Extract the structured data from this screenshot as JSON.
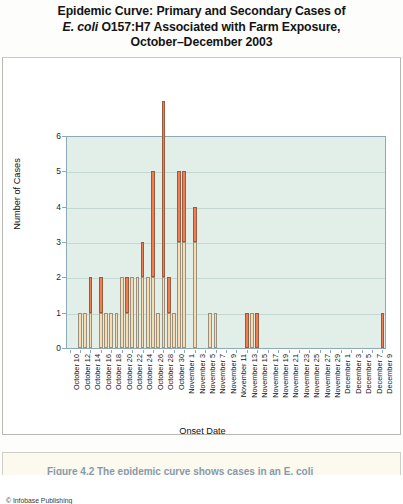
{
  "title": {
    "line1": "Epidemic Curve: Primary and Secondary Cases of",
    "line2_italic": "E. coli",
    "line2_rest": " O157:H7 Associated with Farm Exposure,",
    "line3": "October–December 2003"
  },
  "credit": "© Infobase Publishing",
  "caption": "Figure 4.2  The epidemic curve shows cases in an E. coli",
  "legend": {
    "position": "bottom",
    "items": [
      {
        "label": "Primary Cases",
        "color": "#f8dcae"
      },
      {
        "label": "Secondary cases",
        "color": "#ef7f53"
      }
    ]
  },
  "colors": {
    "primary": "#f8dcae",
    "secondary": "#ef7f53",
    "plot_background": "#e2efe9",
    "gridline": "#c3d8d3",
    "axis": "#8fa8b5"
  },
  "chart_data": {
    "type": "bar",
    "subtype": "stacked-histogram-epidemic-curve",
    "title": "Epidemic Curve: Primary and Secondary Cases of E. coli O157:H7 Associated with Farm Exposure, October–December 2003",
    "xlabel": "Onset Date",
    "ylabel": "Number of Cases",
    "ylim": [
      0,
      6
    ],
    "yticks": [
      0,
      1,
      2,
      3,
      4,
      5,
      6
    ],
    "grid": true,
    "tick_step_days": 2,
    "x_tick_labels": [
      "October 10",
      "October 12",
      "October 14",
      "October 16",
      "October 18",
      "October 20",
      "October 22",
      "October 24",
      "October 26",
      "October 28",
      "October 30",
      "November 1",
      "November 3",
      "November 5",
      "November 7",
      "November 9",
      "November 11",
      "November 13",
      "November 15",
      "November 17",
      "November 19",
      "November 21",
      "November 23",
      "November 25",
      "November 27",
      "November 29",
      "December 1",
      "December 3",
      "December 5",
      "December 7",
      "December 9"
    ],
    "x": [
      "October 10",
      "October 11",
      "October 12",
      "October 13",
      "October 14",
      "October 15",
      "October 16",
      "October 17",
      "October 18",
      "October 19",
      "October 20",
      "October 21",
      "October 22",
      "October 23",
      "October 24",
      "October 25",
      "October 26",
      "October 27",
      "October 28",
      "October 29",
      "October 30",
      "October 31",
      "November 1",
      "November 2",
      "November 3",
      "November 4",
      "November 5",
      "November 6",
      "November 7",
      "November 8",
      "November 9",
      "November 10",
      "November 11",
      "November 12",
      "November 13",
      "November 14",
      "November 15",
      "November 16",
      "November 17",
      "November 18",
      "November 19",
      "November 20",
      "November 21",
      "November 22",
      "November 23",
      "November 24",
      "November 25",
      "November 26",
      "November 27",
      "November 28",
      "November 29",
      "November 30",
      "December 1",
      "December 2",
      "December 3",
      "December 4",
      "December 5",
      "December 6",
      "December 7",
      "December 8",
      "December 9"
    ],
    "series": [
      {
        "name": "Primary Cases",
        "color": "#f8dcae",
        "values": [
          0,
          0,
          1,
          1,
          1,
          0,
          1,
          1,
          1,
          1,
          2,
          1,
          2,
          2,
          2,
          2,
          2,
          1,
          2,
          1,
          1,
          3,
          3,
          0,
          3,
          0,
          0,
          1,
          1,
          0,
          0,
          0,
          0,
          0,
          0,
          1,
          0,
          0,
          0,
          0,
          0,
          0,
          0,
          0,
          0,
          0,
          0,
          0,
          0,
          0,
          0,
          0,
          0,
          0,
          0,
          0,
          0,
          0,
          0,
          0,
          0
        ]
      },
      {
        "name": "Secondary cases",
        "color": "#ef7f53",
        "values": [
          0,
          0,
          0,
          0,
          1,
          0,
          1,
          0,
          0,
          0,
          0,
          1,
          0,
          0,
          1,
          0,
          3,
          0,
          5,
          1,
          0,
          2,
          2,
          0,
          1,
          0,
          0,
          0,
          0,
          0,
          0,
          0,
          0,
          0,
          1,
          0,
          1,
          0,
          0,
          0,
          0,
          0,
          0,
          0,
          0,
          0,
          0,
          0,
          0,
          0,
          0,
          0,
          0,
          0,
          0,
          0,
          0,
          0,
          0,
          0,
          1
        ]
      }
    ],
    "totals": [
      0,
      0,
      1,
      1,
      2,
      0,
      2,
      1,
      1,
      1,
      2,
      2,
      2,
      2,
      3,
      2,
      5,
      1,
      5,
      2,
      1,
      5,
      5,
      0,
      4,
      0,
      0,
      1,
      1,
      0,
      0,
      0,
      0,
      0,
      1,
      1,
      1,
      0,
      0,
      0,
      0,
      0,
      0,
      0,
      0,
      0,
      0,
      0,
      0,
      0,
      0,
      0,
      0,
      0,
      0,
      0,
      0,
      0,
      0,
      0,
      1
    ],
    "peak_total": 5,
    "total_cases": 54
  }
}
